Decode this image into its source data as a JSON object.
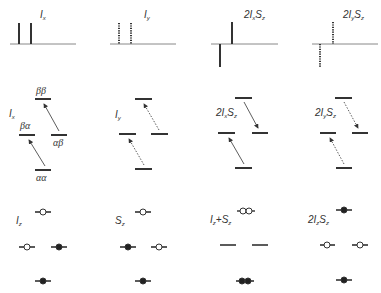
{
  "row1_spectra": [
    {
      "label_main": "I",
      "label_sub": "x",
      "prefix": "",
      "label2_main": "",
      "label2_sub": "",
      "style": "solid",
      "peaks": "in-phase positive"
    },
    {
      "label_main": "I",
      "label_sub": "y",
      "prefix": "",
      "label2_main": "",
      "label2_sub": "",
      "style": "dotted",
      "peaks": "in-phase"
    },
    {
      "label_main": "I",
      "label_sub": "x",
      "prefix": "2",
      "label2_main": "S",
      "label2_sub": "z",
      "style": "solid",
      "peaks": "antiphase"
    },
    {
      "label_main": "I",
      "label_sub": "y",
      "prefix": "2",
      "label2_main": "S",
      "label2_sub": "z",
      "style": "dotted",
      "peaks": "antiphase"
    }
  ],
  "row2_levels": [
    {
      "label": "I",
      "sub": "x",
      "prefix": "",
      "suffix_main": "",
      "suffix_sub": "",
      "states": [
        "ββ",
        "βα",
        "αβ",
        "αα"
      ],
      "arrow_style": "solid"
    },
    {
      "label": "I",
      "sub": "y",
      "prefix": "",
      "suffix_main": "",
      "suffix_sub": "",
      "arrow_style": "dotted"
    },
    {
      "label": "I",
      "sub": "x",
      "prefix": "2",
      "suffix_main": "S",
      "suffix_sub": "z",
      "arrow_style": "solid"
    },
    {
      "label": "I",
      "sub": "y",
      "prefix": "2",
      "suffix_main": "S",
      "suffix_sub": "z",
      "arrow_style": "dotted"
    }
  ],
  "row3_populations": [
    {
      "label": "I",
      "sub": "z",
      "prefix": "",
      "plus": "",
      "suffix_main": "",
      "suffix_sub": "",
      "top": "open",
      "left": "open",
      "right": "filled",
      "bottom": "filled"
    },
    {
      "label": "S",
      "sub": "z",
      "prefix": "",
      "plus": "",
      "suffix_main": "",
      "suffix_sub": "",
      "top": "open",
      "left": "filled",
      "right": "open",
      "bottom": "filled"
    },
    {
      "label": "I",
      "sub": "z",
      "prefix": "",
      "plus": "+",
      "suffix_main": "S",
      "suffix_sub": "z",
      "top": "double-open",
      "left": "none",
      "right": "none",
      "bottom": "double-filled"
    },
    {
      "label": "I",
      "sub": "z",
      "prefix": "2",
      "plus": "",
      "suffix_main": "S",
      "suffix_sub": "z",
      "top": "filled",
      "left": "open",
      "right": "open",
      "bottom": "filled"
    }
  ],
  "colors": {
    "line": "#333333",
    "baseline": "#888888"
  }
}
